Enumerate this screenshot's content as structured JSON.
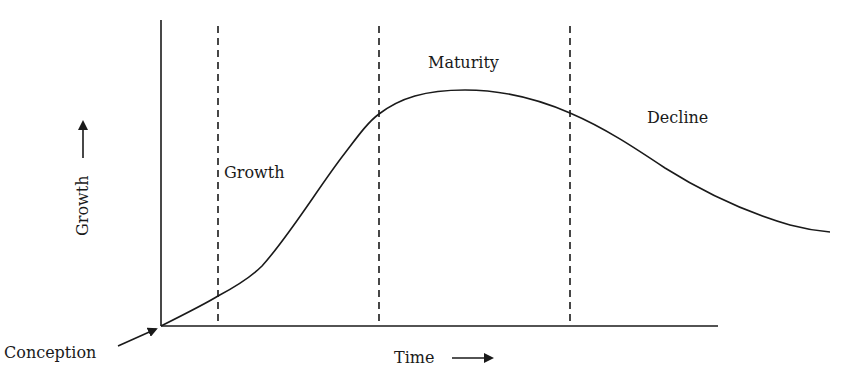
{
  "diagram": {
    "type": "life-cycle-curve",
    "stages": [
      {
        "label": "Growth",
        "x": 224,
        "y": 178
      },
      {
        "label": "Maturity",
        "x": 428,
        "y": 68
      },
      {
        "label": "Decline",
        "x": 647,
        "y": 123
      }
    ],
    "axes": {
      "x_label": "Time",
      "y_label": "Growth",
      "origin_label": "Conception"
    },
    "stage_boundaries_x": [
      218,
      379,
      570
    ],
    "colors": {
      "line": "#1a1a1a",
      "background": "#ffffff"
    }
  }
}
